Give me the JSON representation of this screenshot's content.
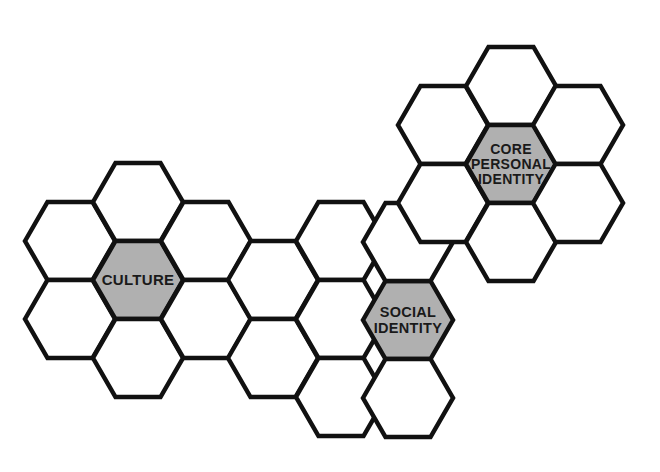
{
  "figure": {
    "title": "",
    "background_color": "#ffffff",
    "outline_color": "#111111",
    "empty_fill_color": "#ffffff",
    "highlight_fill_color": "#b0b0b0",
    "label_color": "#1a1a1a",
    "cropped_title_remnant": "",
    "geometry": {
      "hex_width": 90,
      "hex_height": 78,
      "column_step": 67.5,
      "row_step": 78,
      "odd_column_offset": 39,
      "stroke_width": 4.5
    }
  },
  "labels": {
    "culture": "CULTURE",
    "social_identity_line1": "SOCIAL",
    "social_identity_line2": "IDENTITY",
    "core_line1": "CORE",
    "core_line2": "PERSONAL",
    "core_line3": "IDENTITY"
  },
  "hexagons": [
    {
      "id": "hex-left-upper-left",
      "cx": 70,
      "cy": 241,
      "fill": "empty",
      "label": ""
    },
    {
      "id": "hex-left-lower-left",
      "cx": 70,
      "cy": 319,
      "fill": "empty",
      "label": ""
    },
    {
      "id": "hex-culture-top",
      "cx": 138,
      "cy": 202,
      "fill": "empty",
      "label": ""
    },
    {
      "id": "hex-culture",
      "cx": 138,
      "cy": 280,
      "fill": "highlight",
      "label": "culture"
    },
    {
      "id": "hex-culture-bottom",
      "cx": 138,
      "cy": 358,
      "fill": "empty",
      "label": ""
    },
    {
      "id": "hex-culture-upper-right",
      "cx": 206,
      "cy": 241,
      "fill": "empty",
      "label": ""
    },
    {
      "id": "hex-culture-lower-right",
      "cx": 206,
      "cy": 319,
      "fill": "empty",
      "label": ""
    },
    {
      "id": "hex-mid-upper",
      "cx": 273,
      "cy": 280,
      "fill": "empty",
      "label": ""
    },
    {
      "id": "hex-mid-lower",
      "cx": 273,
      "cy": 358,
      "fill": "empty",
      "label": ""
    },
    {
      "id": "hex-social-top",
      "cx": 341,
      "cy": 241,
      "fill": "empty",
      "label": ""
    },
    {
      "id": "hex-social-upper-left",
      "cx": 341,
      "cy": 319,
      "fill": "empty",
      "label": ""
    },
    {
      "id": "hex-social-bottom",
      "cx": 341,
      "cy": 397,
      "fill": "empty",
      "label": ""
    },
    {
      "id": "hex-social-identity",
      "cx": 408,
      "cy": 320,
      "fill": "highlight",
      "label": "social"
    },
    {
      "id": "hex-social-upper-right",
      "cx": 408,
      "cy": 242,
      "fill": "empty",
      "label": ""
    },
    {
      "id": "hex-social-lower-right",
      "cx": 408,
      "cy": 398,
      "fill": "empty",
      "label": ""
    },
    {
      "id": "hex-core-left",
      "cx": 443,
      "cy": 125,
      "fill": "empty",
      "label": ""
    },
    {
      "id": "hex-core-lower-left",
      "cx": 443,
      "cy": 203,
      "fill": "empty",
      "label": ""
    },
    {
      "id": "hex-core-top",
      "cx": 511,
      "cy": 86,
      "fill": "empty",
      "label": ""
    },
    {
      "id": "hex-core-identity",
      "cx": 511,
      "cy": 164,
      "fill": "highlight",
      "label": "core"
    },
    {
      "id": "hex-core-bottom",
      "cx": 511,
      "cy": 242,
      "fill": "empty",
      "label": ""
    },
    {
      "id": "hex-core-upper-right",
      "cx": 578,
      "cy": 125,
      "fill": "empty",
      "label": ""
    },
    {
      "id": "hex-core-lower-right",
      "cx": 578,
      "cy": 203,
      "fill": "empty",
      "label": ""
    }
  ]
}
